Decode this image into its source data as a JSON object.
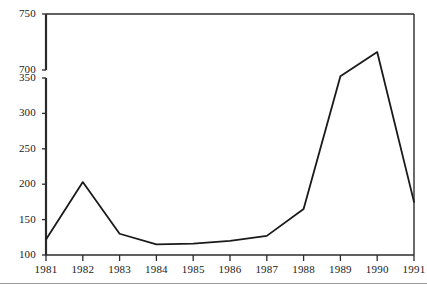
{
  "chart_data": {
    "type": "line",
    "title": "",
    "subtitle": "",
    "xlabel": "",
    "ylabel": "",
    "categories": [
      "1981",
      "1982",
      "1983",
      "1984",
      "1985",
      "1986",
      "1987",
      "1988",
      "1989",
      "1990",
      "1991"
    ],
    "values": [
      122,
      203,
      130,
      115,
      116,
      120,
      127,
      165,
      430,
      716,
      175
    ],
    "series": [
      {
        "name": "series-1",
        "values": [
          122,
          203,
          130,
          115,
          116,
          120,
          127,
          165,
          430,
          716,
          175
        ]
      }
    ],
    "y_tick_labels": [
      "750",
      "700",
      "350",
      "300",
      "250",
      "200",
      "150",
      "100"
    ],
    "y_tick_values": [
      750,
      700,
      350,
      300,
      250,
      200,
      150,
      100
    ],
    "x_tick_labels": [
      "1981",
      "1982",
      "1983",
      "1984",
      "1985",
      "1986",
      "1987",
      "1988",
      "1989",
      "1990",
      "1991"
    ],
    "ylim": [
      100,
      750
    ],
    "xlim": [
      "1981",
      "1991"
    ],
    "axis_break": {
      "present": true,
      "lower_value": 350,
      "upper_value": 700
    },
    "grid": false,
    "legend": "none",
    "line_color": "#1a1a1a",
    "axis_color": "#2b2b2b",
    "background_color": "#ffffff"
  },
  "figure": {
    "bottom_rule_color": "#9a9a9a"
  }
}
